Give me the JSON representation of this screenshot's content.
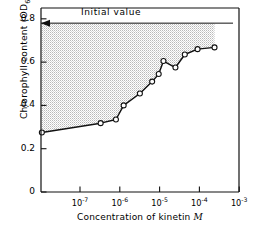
{
  "chart_data": {
    "type": "line",
    "title": "",
    "xlabel": "Concentration of kinetin M",
    "xlabel_plain": "Concentration of kinetin",
    "xlabel_italic": "M",
    "ylabel": "Chlorophyll content (OD665)",
    "ylabel_main": "Chlorophyll content (OD",
    "ylabel_sub": "665",
    "ylabel_tail": ")",
    "xscale": "log",
    "yscale": "linear",
    "xlim": [
      1.05e-08,
      0.001
    ],
    "ylim": [
      0,
      0.85
    ],
    "grid": false,
    "legend": null,
    "xticks": [
      1e-07,
      1e-06,
      1e-05,
      0.0001,
      0.001
    ],
    "xtick_labels": [
      "10-7",
      "10-6",
      "10-5",
      "10-4",
      "10-3"
    ],
    "xtick_mantissa": [
      "10",
      "10",
      "10",
      "10",
      "10"
    ],
    "xtick_exponents": [
      "-7",
      "-6",
      "-5",
      "-4",
      "-3"
    ],
    "yticks": [
      0,
      0.2,
      0.4,
      0.6,
      0.8
    ],
    "ytick_labels": [
      "0",
      "0.2",
      "0.4",
      "0.6",
      "0.8"
    ],
    "x": [
      1.1e-08,
      3.3e-07,
      8e-07,
      1.25e-06,
      3.2e-06,
      6.5e-06,
      9.5e-06,
      1.25e-05,
      2.5e-05,
      4.3e-05,
      9e-05,
      0.00024
    ],
    "values": [
      0.275,
      0.318,
      0.335,
      0.4,
      0.455,
      0.51,
      0.545,
      0.605,
      0.575,
      0.635,
      0.66,
      0.668
    ],
    "series": [
      {
        "name": "Chlorophyll content",
        "marker": "open-circle",
        "x": [
          1.1e-08,
          3.3e-07,
          8e-07,
          1.25e-06,
          3.2e-06,
          6.5e-06,
          9.5e-06,
          1.25e-05,
          2.5e-05,
          4.3e-05,
          9e-05,
          0.00024
        ],
        "values": [
          0.275,
          0.318,
          0.335,
          0.4,
          0.455,
          0.51,
          0.545,
          0.605,
          0.575,
          0.635,
          0.66,
          0.668
        ]
      }
    ],
    "annotations": [
      {
        "text": "Initial value",
        "y": 0.78,
        "arrow": "left",
        "style": "horizontal-line-with-left-arrow"
      }
    ],
    "shaded_region": {
      "label": "area between curve and initial value",
      "pattern": "stipple",
      "upper_y": 0.78,
      "color": "#c9c9c9"
    },
    "colors": {
      "line": "#111111",
      "marker_fill": "#ffffff",
      "marker_edge": "#111111",
      "axis": "#111111",
      "shading": "#c4c4c4"
    }
  }
}
